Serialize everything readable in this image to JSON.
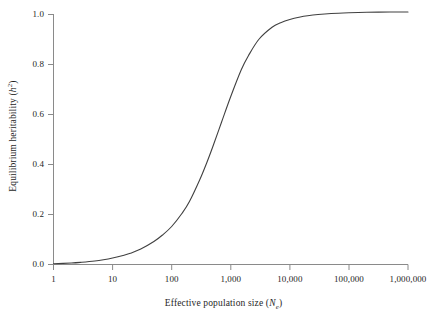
{
  "figure": {
    "background_color": "#ffffff",
    "line_color": "#404040",
    "axis_color": "#808080",
    "text_color": "#262626"
  },
  "axes": {
    "x_title_prefix": "Effective population size (",
    "x_title_symbol": "N",
    "x_title_subscript": "e",
    "x_title_suffix": ")",
    "y_title_prefix": "Equilibrium heritability (",
    "y_title_symbol": "h",
    "y_title_superscript": "2",
    "y_title_suffix": ")"
  },
  "chart_data": {
    "type": "line",
    "title": "",
    "xlabel": "Effective population size (Ne)",
    "ylabel": "Equilibrium heritability (h2)",
    "xscale": "log10",
    "xlim": [
      1,
      1000000
    ],
    "ylim": [
      0.0,
      1.02
    ],
    "grid": false,
    "legend": "none",
    "xticks": [
      1,
      10,
      100,
      1000,
      10000,
      100000,
      1000000
    ],
    "xticklabels": [
      "1",
      "10",
      "100",
      "1,000",
      "10,000",
      "100,000",
      "1,000,000"
    ],
    "yticks": [
      0.0,
      0.2,
      0.4,
      0.6,
      0.8,
      1.0
    ],
    "yticklabels": [
      "0.0",
      "0.2",
      "0.4",
      "0.6",
      "0.8",
      "1.0"
    ],
    "series": [
      {
        "name": "Equilibrium heritability",
        "x": [
          1,
          2,
          3,
          5,
          7,
          10,
          15,
          20,
          30,
          50,
          70,
          100,
          150,
          200,
          300,
          400,
          500,
          700,
          1000,
          1500,
          2000,
          3000,
          5000,
          7000,
          10000,
          15000,
          20000,
          30000,
          50000,
          100000,
          200000,
          500000,
          1000000
        ],
        "y": [
          0.003,
          0.006,
          0.009,
          0.014,
          0.019,
          0.026,
          0.036,
          0.045,
          0.062,
          0.092,
          0.118,
          0.152,
          0.205,
          0.252,
          0.34,
          0.412,
          0.473,
          0.57,
          0.672,
          0.778,
          0.836,
          0.901,
          0.949,
          0.967,
          0.98,
          0.99,
          0.995,
          1.0,
          1.004,
          1.007,
          1.009,
          1.01,
          1.01
        ]
      }
    ]
  }
}
